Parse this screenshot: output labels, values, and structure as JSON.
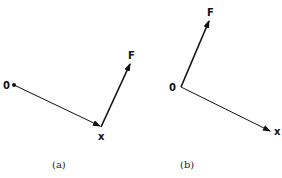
{
  "panels": [
    {
      "caption": "(a)",
      "labels": {
        "origin": "0",
        "x": "x",
        "force": "F"
      },
      "vectors": [
        {
          "name": "position",
          "from": [
            14,
            85
          ],
          "to": [
            101,
            126
          ]
        },
        {
          "name": "force",
          "from": [
            101,
            126
          ],
          "to": [
            130,
            64
          ]
        }
      ]
    },
    {
      "caption": "(b)",
      "labels": {
        "origin": "0",
        "x": "x",
        "force": "F"
      },
      "vectors": [
        {
          "name": "force",
          "from": [
            181,
            87
          ],
          "to": [
            209,
            21
          ]
        },
        {
          "name": "position",
          "from": [
            181,
            87
          ],
          "to": [
            270,
            131
          ]
        }
      ]
    }
  ],
  "colors": {
    "line": "#111111"
  }
}
